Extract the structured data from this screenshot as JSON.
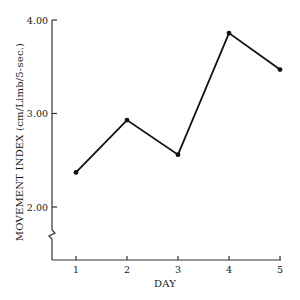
{
  "chart_data": {
    "type": "line",
    "title": "",
    "xlabel": "DAY",
    "ylabel": "MOVEMENT INDEX (cm/Limb/5-sec.)",
    "categories": [
      "1",
      "2",
      "3",
      "4",
      "5"
    ],
    "x": [
      1,
      2,
      3,
      4,
      5
    ],
    "series": [
      {
        "name": "Movement Index",
        "values": [
          2.37,
          2.93,
          2.56,
          3.86,
          3.47
        ]
      }
    ],
    "yticks": [
      2.0,
      3.0,
      4.0
    ],
    "ytick_labels": [
      "2.00",
      "3.00",
      "4.00"
    ],
    "ylim": [
      1.42,
      4.0
    ],
    "xlim": [
      0.5,
      5
    ],
    "grid": false,
    "legend": null,
    "axis_break": "y-axis break below 2.00",
    "colors": {
      "line": "#111111",
      "axis": "#333333"
    }
  },
  "labels": {
    "x_title": "DAY",
    "y_title": "MOVEMENT INDEX (cm/Limb/5-sec.)"
  }
}
